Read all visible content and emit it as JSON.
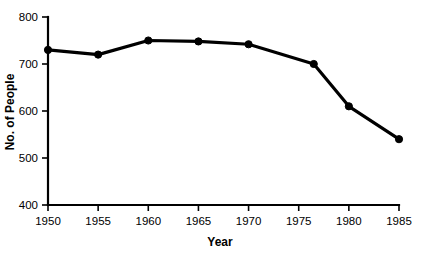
{
  "chart_data": {
    "type": "line",
    "title": "",
    "xlabel": "Year",
    "ylabel": "No. of People",
    "xlim": [
      1950,
      1985
    ],
    "ylim": [
      400,
      800
    ],
    "xticks": [
      1950,
      1955,
      1960,
      1965,
      1970,
      1975,
      1980,
      1985
    ],
    "xtick_labels": [
      "1950",
      "1955",
      "1960",
      "1965",
      "1970",
      "1975",
      "1980",
      "1985"
    ],
    "yticks": [
      400,
      500,
      600,
      700,
      800
    ],
    "ytick_labels": [
      "400",
      "500",
      "600",
      "700",
      "800"
    ],
    "grid": false,
    "legend": false,
    "marker": "filled-circle",
    "line_color": "#000000",
    "x": [
      1950,
      1955,
      1960,
      1965,
      1970,
      1976.5,
      1980,
      1985
    ],
    "values": [
      730,
      720,
      750,
      748,
      742,
      700,
      610,
      540
    ],
    "points": [
      {
        "x": 1950,
        "y": 730
      },
      {
        "x": 1955,
        "y": 720
      },
      {
        "x": 1960,
        "y": 750
      },
      {
        "x": 1965,
        "y": 748
      },
      {
        "x": 1970,
        "y": 742
      },
      {
        "x": 1976.5,
        "y": 700
      },
      {
        "x": 1980,
        "y": 610
      },
      {
        "x": 1985,
        "y": 540
      }
    ]
  }
}
